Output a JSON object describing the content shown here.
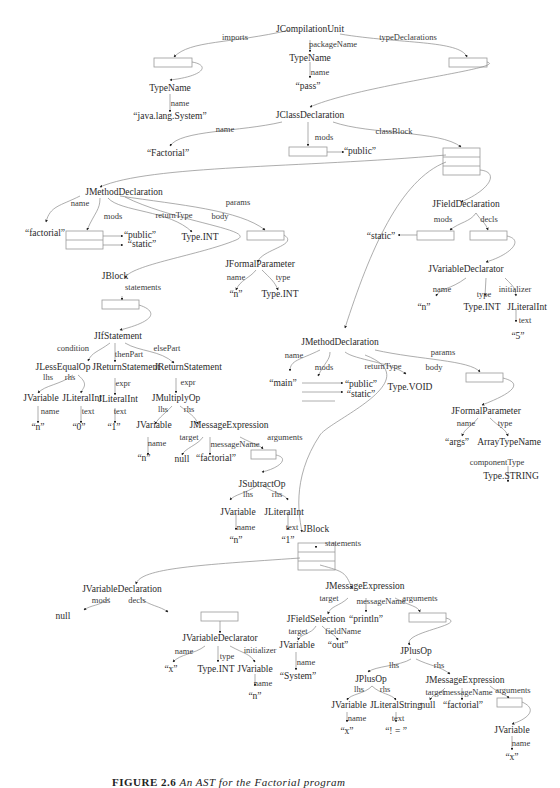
{
  "figure": {
    "caption_label": "FIGURE 2.6",
    "caption_text": "An AST for the Factorial program"
  },
  "nodes": {
    "compilation_unit": "JCompilationUnit",
    "pkg_typename": "TypeName",
    "pkg_name_value": "“pass”",
    "import_typename": "TypeName",
    "import_name_value": "“java.lang.System”",
    "class_decl": "JClassDeclaration",
    "class_name_value": "“Factorial”",
    "class_mod_public": "“public”",
    "m1_decl": "JMethodDeclaration",
    "m1_name_value": "“factorial”",
    "m1_mod_public": "“public”",
    "m1_mod_static": "“static”",
    "m1_return_type": "Type.INT",
    "m1_param": "JFormalParameter",
    "m1_param_name": "“n”",
    "m1_param_type": "Type.INT",
    "m1_block": "JBlock",
    "if_stmt": "JIfStatement",
    "lte_op": "JLessEqualOp",
    "lte_lhs_var": "JVariable",
    "lte_lhs_name": "“n”",
    "lte_rhs_lit": "JLiteralInt",
    "lte_rhs_text": "“0”",
    "then_return": "JReturnStatement",
    "then_lit": "JLiteralInt",
    "then_text": "“1”",
    "else_return": "JReturnStatement",
    "mul_op": "JMultiplyOp",
    "mul_lhs_var": "JVariable",
    "mul_lhs_name": "“n”",
    "msg1": "JMessageExpression",
    "msg1_target": "null",
    "msg1_name": "“factorial”",
    "sub_op": "JSubtractOp",
    "sub_lhs_var": "JVariable",
    "sub_lhs_name": "“n”",
    "sub_rhs_lit": "JLiteralInt",
    "sub_rhs_text": "“1”",
    "field_decl": "JFieldDeclaration",
    "field_mod_static": "“static”",
    "field_declarator": "JVariableDeclarator",
    "field_var_name": "“n”",
    "field_var_type": "Type.INT",
    "field_init": "JLiteralInt",
    "field_init_text": "“5”",
    "m2_decl": "JMethodDeclaration",
    "m2_name_value": "“main”",
    "m2_mod_public": "“public”",
    "m2_mod_static": "“static”",
    "m2_return_type": "Type.VOID",
    "m2_param": "JFormalParameter",
    "m2_param_name": "“args”",
    "m2_param_type": "ArrayTypeName",
    "m2_component_type": "Type.STRING",
    "m2_block": "JBlock",
    "var_decl": "JVariableDeclaration",
    "var_decl_mods": "null",
    "var_declarator": "JVariableDeclarator",
    "var_x_name": "“x”",
    "var_x_type": "Type.INT",
    "var_x_init": "JVariable",
    "var_x_init_name": "“n”",
    "msg2": "JMessageExpression",
    "field_sel": "JFieldSelection",
    "field_sel_target": "JVariable",
    "field_sel_target_name": "“System”",
    "field_sel_field": "“out”",
    "msg2_name": "“println”",
    "plus_outer": "JPlusOp",
    "plus_inner": "JPlusOp",
    "plus_inner_lhs": "JVariable",
    "plus_inner_lhs_name": "“x”",
    "plus_inner_rhs": "JLiteralString",
    "plus_inner_rhs_text": "“! = ”",
    "msg3": "JMessageExpression",
    "msg3_target": "null",
    "msg3_name": "“factorial”",
    "msg3_arg": "JVariable",
    "msg3_arg_name": "“x”"
  },
  "edges": {
    "imports": "imports",
    "packageName": "packageName",
    "typeDeclarations": "typeDeclarations",
    "name": "name",
    "mods": "mods",
    "classBlock": "classBlock",
    "params": "params",
    "returnType": "returnType",
    "body": "body",
    "type": "type",
    "statements": "statements",
    "decls": "decls",
    "initializer": "initializer",
    "text": "text",
    "condition": "condition",
    "thenPart": "thenPart",
    "elsePart": "elsePart",
    "lhs": "lhs",
    "rhs": "rhs",
    "expr": "expr",
    "target": "target",
    "messageName": "messageName",
    "arguments": "arguments",
    "componentType": "componentType",
    "fieldName": "fieldName"
  }
}
